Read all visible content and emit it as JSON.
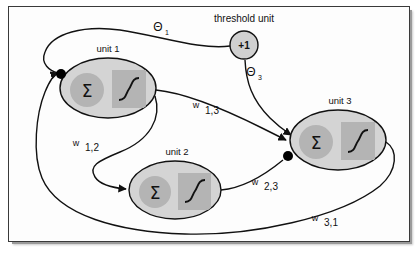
{
  "figure": {
    "type": "neural-network-diagram",
    "title": ""
  },
  "colors": {
    "frame_border": "#3a3a3a",
    "frame_shadow": "#9a9a9a",
    "background": "#ffffff",
    "unit_body": "#d4d4d4",
    "sum_circle": "#b4b4b4",
    "sigmoid_box": "#b4b4b4",
    "threshold_fill": "#d0d0d0",
    "stroke": "#111111",
    "junction_dot": "#000000",
    "text": "#111111"
  },
  "units": [
    {
      "id": "unit1",
      "label": "unit 1",
      "sum_symbol": "Σ",
      "activation_symbol": "sigmoid",
      "cx": 108,
      "cy": 88,
      "rx": 48,
      "ry": 30
    },
    {
      "id": "unit2",
      "label": "unit 2",
      "sum_symbol": "Σ",
      "activation_symbol": "sigmoid",
      "cx": 175,
      "cy": 190,
      "rx": 46,
      "ry": 29
    },
    {
      "id": "unit3",
      "label": "unit 3",
      "sum_symbol": "Σ",
      "activation_symbol": "sigmoid",
      "cx": 338,
      "cy": 140,
      "rx": 48,
      "ry": 30
    }
  ],
  "threshold_unit": {
    "id": "threshold",
    "label": "threshold unit",
    "value": "+1",
    "cx": 244,
    "cy": 45,
    "r": 14
  },
  "connections": [
    {
      "id": "theta1",
      "label": "Θ",
      "subscript": "1",
      "from": "threshold",
      "to": "unit1",
      "label_x": 158,
      "label_y": 31
    },
    {
      "id": "theta3",
      "label": "Θ",
      "subscript": "3",
      "from": "threshold",
      "to": "unit3",
      "label_x": 251,
      "label_y": 76
    },
    {
      "id": "w12",
      "label": "w",
      "subscript": "1,2",
      "from": "unit1",
      "to": "unit2",
      "label_x": 76,
      "label_y": 146
    },
    {
      "id": "w13",
      "label": "w",
      "subscript": "1,3",
      "from": "unit1",
      "to": "unit3",
      "label_x": 196,
      "label_y": 108
    },
    {
      "id": "w23",
      "label": "w",
      "subscript": "2,3",
      "from": "unit2",
      "to": "unit3",
      "label_x": 255,
      "label_y": 185
    },
    {
      "id": "w31",
      "label": "w",
      "subscript": "3,1",
      "from": "unit3",
      "to": "unit1",
      "label_x": 315,
      "label_y": 221
    }
  ],
  "junction_dots": [
    {
      "id": "junction-unit1-input",
      "cx": 61,
      "cy": 74,
      "r": 5
    },
    {
      "id": "junction-unit3-input",
      "cx": 288,
      "cy": 156,
      "r": 5
    }
  ]
}
